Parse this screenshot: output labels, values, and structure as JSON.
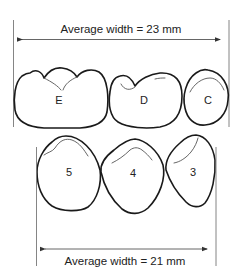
{
  "diagram": {
    "top_dimension": {
      "label": "Average width = 23 mm",
      "value_mm": 23
    },
    "bottom_dimension": {
      "label": "Average width = 21 mm",
      "value_mm": 21
    },
    "upper_row": {
      "teeth": [
        {
          "label": "E"
        },
        {
          "label": "D"
        },
        {
          "label": "C"
        }
      ]
    },
    "lower_row": {
      "teeth": [
        {
          "label": "5"
        },
        {
          "label": "4"
        },
        {
          "label": "3"
        }
      ]
    },
    "colors": {
      "outline": "#1a1a1a",
      "dimension_line": "#555555",
      "background": "#ffffff"
    }
  }
}
